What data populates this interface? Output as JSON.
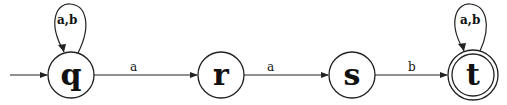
{
  "automaton": {
    "states": [
      {
        "id": "q",
        "label": "q",
        "start": true,
        "accepting": false
      },
      {
        "id": "r",
        "label": "r",
        "start": false,
        "accepting": false
      },
      {
        "id": "s",
        "label": "s",
        "start": false,
        "accepting": false
      },
      {
        "id": "t",
        "label": "t",
        "start": false,
        "accepting": true
      }
    ],
    "transitions": [
      {
        "from": "q",
        "to": "q",
        "label": "a,b"
      },
      {
        "from": "q",
        "to": "r",
        "label": "a"
      },
      {
        "from": "r",
        "to": "s",
        "label": "a"
      },
      {
        "from": "s",
        "to": "t",
        "label": "b"
      },
      {
        "from": "t",
        "to": "t",
        "label": "a,b"
      }
    ]
  },
  "labels": {
    "q": "q",
    "r": "r",
    "s": "s",
    "t": "t",
    "loop_q": "a,b",
    "q_r": "a",
    "r_s": "a",
    "s_t": "b",
    "loop_t": "a,b"
  }
}
